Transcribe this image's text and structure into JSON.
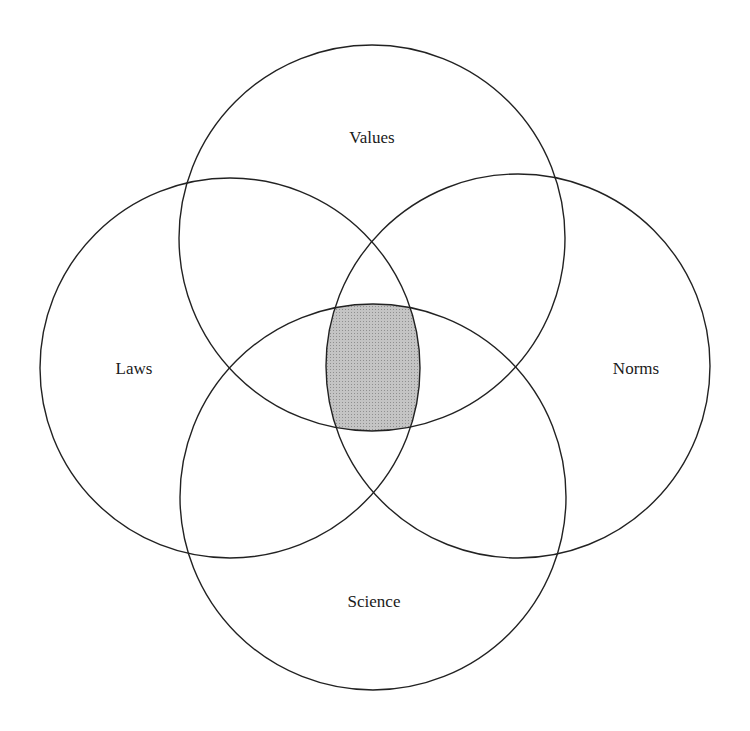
{
  "diagram": {
    "type": "venn",
    "sets": [
      {
        "id": "values",
        "label": "Values",
        "cx": 372,
        "cy": 238,
        "r": 193,
        "label_x": 372,
        "label_y": 138
      },
      {
        "id": "laws",
        "label": "Laws",
        "cx": 230,
        "cy": 368,
        "r": 190,
        "label_x": 134,
        "label_y": 369
      },
      {
        "id": "norms",
        "label": "Norms",
        "cx": 518,
        "cy": 366,
        "r": 192,
        "label_x": 636,
        "label_y": 369
      },
      {
        "id": "science",
        "label": "Science",
        "cx": 373,
        "cy": 497,
        "r": 193,
        "label_x": 374,
        "label_y": 602
      }
    ],
    "highlight": {
      "region": "intersection of all four sets",
      "fill": "#bdbdbd"
    },
    "stroke_color": "#222222"
  }
}
